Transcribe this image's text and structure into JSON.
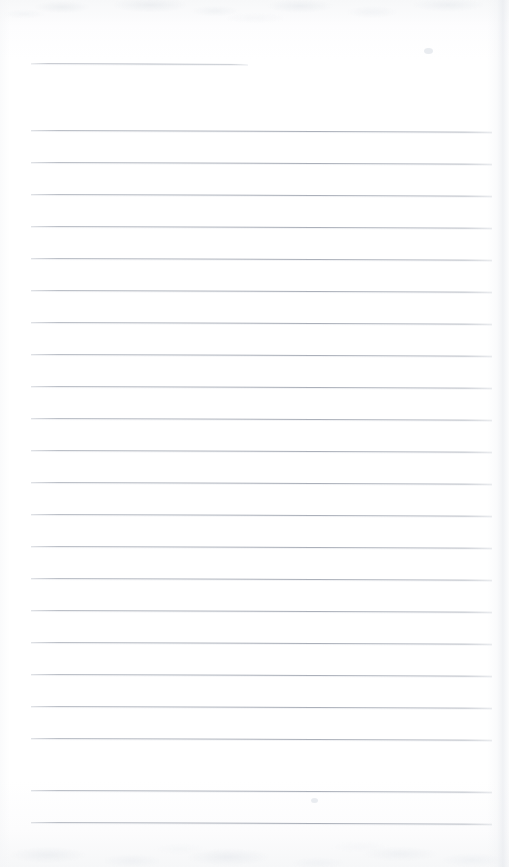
{
  "document": {
    "type": "scanned-lined-notebook-page",
    "title": "Blank ruled notebook page",
    "page_width": 509,
    "page_height": 867,
    "background_color": "#ffffff",
    "paper_tone": "#fdfdfe",
    "rule_color": "#a8adb7",
    "rule_thickness_px": 1,
    "content_text": "",
    "writing_present": "none"
  },
  "layout": {
    "left_margin_x": 31,
    "right_margin_x": 492,
    "line_spacing_px": 32,
    "first_rule_y": 63,
    "first_full_rule_y": 130,
    "last_rule_y": 822,
    "total_rules": 23,
    "full_width_rules": 22
  },
  "header_rule": {
    "label": "header-rule",
    "x_start": 31,
    "x_end": 248,
    "y": 63,
    "width": 217,
    "slope_deg": 0.26,
    "note": "short rule, approximately half page width"
  },
  "rules": [
    {
      "index": 1,
      "y": 130,
      "x_start": 31,
      "width": 461,
      "slope_deg": 0.22
    },
    {
      "index": 2,
      "y": 162,
      "x_start": 31,
      "width": 461,
      "slope_deg": 0.22
    },
    {
      "index": 3,
      "y": 194,
      "x_start": 31,
      "width": 461,
      "slope_deg": 0.22
    },
    {
      "index": 4,
      "y": 226,
      "x_start": 31,
      "width": 461,
      "slope_deg": 0.22
    },
    {
      "index": 5,
      "y": 258,
      "x_start": 31,
      "width": 461,
      "slope_deg": 0.22
    },
    {
      "index": 6,
      "y": 290,
      "x_start": 31,
      "width": 461,
      "slope_deg": 0.22
    },
    {
      "index": 7,
      "y": 322,
      "x_start": 31,
      "width": 461,
      "slope_deg": 0.22
    },
    {
      "index": 8,
      "y": 354,
      "x_start": 31,
      "width": 461,
      "slope_deg": 0.22
    },
    {
      "index": 9,
      "y": 386,
      "x_start": 31,
      "width": 461,
      "slope_deg": 0.22
    },
    {
      "index": 10,
      "y": 418,
      "x_start": 31,
      "width": 461,
      "slope_deg": 0.22
    },
    {
      "index": 11,
      "y": 450,
      "x_start": 31,
      "width": 461,
      "slope_deg": 0.22
    },
    {
      "index": 12,
      "y": 482,
      "x_start": 31,
      "width": 461,
      "slope_deg": 0.22
    },
    {
      "index": 13,
      "y": 514,
      "x_start": 31,
      "width": 461,
      "slope_deg": 0.22
    },
    {
      "index": 14,
      "y": 546,
      "x_start": 31,
      "width": 461,
      "slope_deg": 0.22
    },
    {
      "index": 15,
      "y": 578,
      "x_start": 31,
      "width": 461,
      "slope_deg": 0.22
    },
    {
      "index": 16,
      "y": 610,
      "x_start": 31,
      "width": 461,
      "slope_deg": 0.22
    },
    {
      "index": 17,
      "y": 642,
      "x_start": 31,
      "width": 461,
      "slope_deg": 0.22
    },
    {
      "index": 18,
      "y": 674,
      "x_start": 31,
      "width": 461,
      "slope_deg": 0.22
    },
    {
      "index": 19,
      "y": 706,
      "x_start": 31,
      "width": 461,
      "slope_deg": 0.22
    },
    {
      "index": 20,
      "y": 738,
      "x_start": 31,
      "width": 461,
      "slope_deg": 0.22
    },
    {
      "index": 21,
      "y": 790,
      "x_start": 31,
      "width": 461,
      "slope_deg": 0.22
    },
    {
      "index": 22,
      "y": 822,
      "x_start": 31,
      "width": 461,
      "slope_deg": 0.22
    }
  ],
  "artifacts": {
    "top_edge_texture": true,
    "bottom_edge_texture": true,
    "right_edge_shadow": true,
    "left_edge_shadow": true,
    "specks": [
      {
        "x": 424,
        "y": 48,
        "w": 9,
        "h": 6
      },
      {
        "x": 311,
        "y": 798,
        "w": 7,
        "h": 5
      }
    ]
  }
}
